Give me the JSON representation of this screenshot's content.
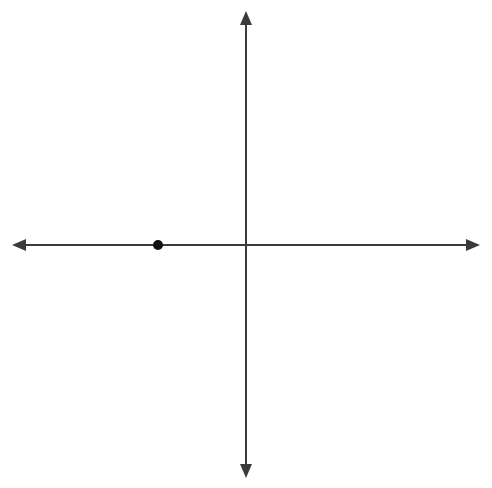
{
  "chart_data": {
    "type": "scatter",
    "title": "",
    "xlabel": "x",
    "ylabel": "y",
    "xlim": [
      -10,
      10
    ],
    "ylim": [
      -10,
      10
    ],
    "grid": true,
    "grid_step": 1,
    "major_grid_step": 2,
    "legend": "none",
    "x_ticks": [
      -10,
      -8,
      -6,
      -4,
      -2,
      0,
      2,
      4,
      6,
      8,
      10
    ],
    "y_ticks": [
      -10,
      -8,
      -6,
      -4,
      -2,
      2,
      4,
      6,
      8,
      10
    ],
    "x_tick_labels": [
      "–10",
      "–8",
      "–6",
      "–4",
      "–2",
      "0",
      "2",
      "4",
      "6",
      "8",
      "10"
    ],
    "y_tick_labels": [
      "–10",
      "–8",
      "–6",
      "–4",
      "–2",
      "2",
      "4",
      "6",
      "8",
      "10"
    ],
    "points": [
      {
        "label": "C",
        "x": -4,
        "y": 0
      }
    ],
    "series": [
      {
        "name": "plotted-points",
        "values": [
          [
            -4,
            0
          ]
        ]
      }
    ]
  },
  "axes": {
    "x_axis_name": "x",
    "y_axis_name": "y",
    "origin_label": "0",
    "arrows": [
      "left",
      "right",
      "up",
      "down"
    ]
  },
  "colors": {
    "axis": "#3b3b3b",
    "major_grid": "#c6c6c6",
    "minor_grid": "#e9e9e9",
    "point": "#111111",
    "label_text": "#1a1a1a",
    "background": "#ffffff"
  }
}
